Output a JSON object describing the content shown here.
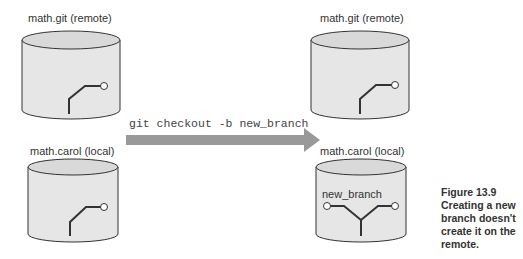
{
  "diagram": {
    "left": {
      "remote_label": "math.git (remote)",
      "local_label": "math.carol (local)"
    },
    "arrow": {
      "command": "git checkout -b new_branch",
      "color": "#999999"
    },
    "right": {
      "remote_label": "math.git (remote)",
      "local_label": "math.carol (local)",
      "branch_label": "new_branch"
    },
    "caption": {
      "title": "Figure 13.9",
      "text": "Creating a new branch doesn't create it on the remote."
    },
    "colors": {
      "cylinder_fill": "#e4e4e4",
      "cylinder_top": "#dadada",
      "outline": "#333333"
    }
  }
}
